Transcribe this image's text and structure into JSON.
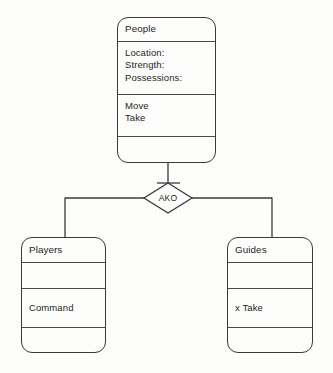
{
  "diagram": {
    "kind": "class-inheritance-diagram",
    "relationship_label": "AKO",
    "classes": {
      "people": {
        "name": "People",
        "attributes": [
          "Location:",
          "Strength:",
          "Possessions:"
        ],
        "methods": [
          "Move",
          "Take"
        ],
        "extra": ""
      },
      "players": {
        "name": "Players",
        "blank": "",
        "body": [
          "Command"
        ],
        "extra": ""
      },
      "guides": {
        "name": "Guides",
        "blank": "",
        "body": [
          "x Take"
        ],
        "extra": ""
      }
    }
  },
  "colors": {
    "background": "#fdfdfb",
    "stroke": "#3a3a3a",
    "divider": "#4a4a4a",
    "text": "#1d1d1d"
  }
}
